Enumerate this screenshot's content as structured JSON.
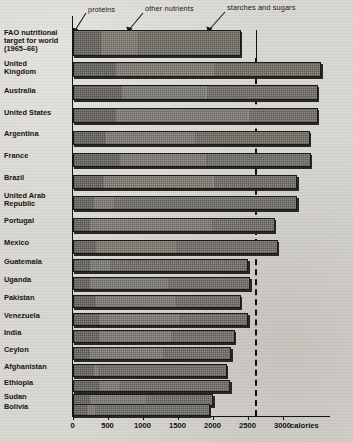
{
  "chart_data": {
    "type": "bar",
    "orientation": "horizontal",
    "stacked": true,
    "title": "",
    "xlabel": "calories",
    "ylabel": "",
    "xlim": [
      0,
      3300
    ],
    "grid": false,
    "legend_position": "top-annotations",
    "xticks": [
      0,
      500,
      1000,
      1500,
      2000,
      2500,
      3000
    ],
    "xtick_labels": [
      "0",
      "500",
      "1000",
      "1500",
      "2000",
      "2500",
      "3000"
    ],
    "axis_unit_label": "calories",
    "series": [
      {
        "name": "proteins",
        "key": "proteins"
      },
      {
        "name": "other nutrients",
        "key": "other_nutrients"
      },
      {
        "name": "starches and sugars",
        "key": "starches_and_sugars"
      }
    ],
    "categories": [
      "FAO nutritional target for world (1965–66)",
      "United Kingdom",
      "Australia",
      "United States",
      "Argentina",
      "France",
      "Brazil",
      "United Arab Republic",
      "Portugal",
      "Mexico",
      "Guatemala",
      "Uganda",
      "Pakistan",
      "Venezuela",
      "India",
      "Ceylon",
      "Afghanistan",
      "Ethiopia",
      "Sudan",
      "Bolivia"
    ],
    "rows": [
      {
        "label": "FAO nutritional\ntarget for world\n(1965–66)",
        "proteins": 390,
        "other_nutrients": 530,
        "starches_and_sugars": 1480,
        "total": 2400
      },
      {
        "label": "United\nKingdom",
        "proteins": 600,
        "other_nutrients": 1400,
        "starches_and_sugars": 1550,
        "total": 3550
      },
      {
        "label": "Australia",
        "proteins": 690,
        "other_nutrients": 1210,
        "starches_and_sugars": 1600,
        "total": 3500
      },
      {
        "label": "United States",
        "proteins": 610,
        "other_nutrients": 1890,
        "starches_and_sugars": 1000,
        "total": 3500
      },
      {
        "label": "Argentina",
        "proteins": 450,
        "other_nutrients": 1280,
        "starches_and_sugars": 1660,
        "total": 3390
      },
      {
        "label": "France",
        "proteins": 660,
        "other_nutrients": 1250,
        "starches_and_sugars": 1490,
        "total": 3400
      },
      {
        "label": "Brazil",
        "proteins": 420,
        "other_nutrients": 1580,
        "starches_and_sugars": 1210,
        "total": 3210
      },
      {
        "label": "United Arab\nRepublic",
        "proteins": 290,
        "other_nutrients": 290,
        "starches_and_sugars": 2630,
        "total": 3210
      },
      {
        "label": "Portugal",
        "proteins": 230,
        "other_nutrients": 1750,
        "starches_and_sugars": 910,
        "total": 2890
      },
      {
        "label": "Mexico",
        "proteins": 320,
        "other_nutrients": 1160,
        "starches_and_sugars": 1450,
        "total": 2930
      },
      {
        "label": "Guatemala",
        "proteins": 240,
        "other_nutrients": 280,
        "starches_and_sugars": 1990,
        "total": 2510
      },
      {
        "label": "Uganda",
        "proteins": 230,
        "other_nutrients": 1140,
        "starches_and_sugars": 1170,
        "total": 2540
      },
      {
        "label": "Pakistan",
        "proteins": 300,
        "other_nutrients": 1160,
        "starches_and_sugars": 940,
        "total": 2400
      },
      {
        "label": "Venezuela",
        "proteins": 360,
        "other_nutrients": 1160,
        "starches_and_sugars": 990,
        "total": 2510
      },
      {
        "label": "India",
        "proteins": 370,
        "other_nutrients": 1020,
        "starches_and_sugars": 930,
        "total": 2320
      },
      {
        "label": "Ceylon",
        "proteins": 220,
        "other_nutrients": 1060,
        "starches_and_sugars": 990,
        "total": 2270
      },
      {
        "label": "Afghanistan",
        "proteins": 290,
        "other_nutrients": 80,
        "starches_and_sugars": 1830,
        "total": 2200
      },
      {
        "label": "Ethiopia",
        "proteins": 370,
        "other_nutrients": 300,
        "starches_and_sugars": 1580,
        "total": 2250
      },
      {
        "label": "Sudan",
        "proteins": 240,
        "other_nutrients": 800,
        "starches_and_sugars": 970,
        "total": 2010
      },
      {
        "label": "Bolivia",
        "proteins": 190,
        "other_nutrients": 110,
        "starches_and_sugars": 1660,
        "total": 1960
      }
    ],
    "annotations": [
      {
        "text": "proteins",
        "target_row": 0,
        "target_series": "proteins"
      },
      {
        "text": "other nutrients",
        "target_row": 0,
        "target_series": "other_nutrients"
      },
      {
        "text": "starches and sugars",
        "target_row": 0,
        "target_series": "starches_and_sugars"
      }
    ],
    "reference_line": {
      "name": "fao-target-line",
      "value": 2400,
      "style": "dashed",
      "label": ""
    },
    "colors": {
      "ink": "#14120e",
      "proteins_fill": "#84827b",
      "other_nutrients_fill": "#96948d",
      "starches_fill": "#8b8982",
      "paper": "#d9d7d1"
    }
  }
}
